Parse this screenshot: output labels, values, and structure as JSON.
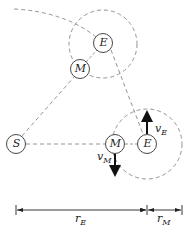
{
  "diagram": {
    "bodies": [
      {
        "id": "sun",
        "label": "S",
        "cx": 16,
        "cy": 144
      },
      {
        "id": "earth-upper",
        "label": "E",
        "cx": 103,
        "cy": 43
      },
      {
        "id": "moon-upper",
        "label": "M",
        "cx": 80,
        "cy": 69
      },
      {
        "id": "moon-lower",
        "label": "M",
        "cx": 115,
        "cy": 144
      },
      {
        "id": "earth-lower",
        "label": "E",
        "cx": 147,
        "cy": 144
      }
    ],
    "velocities": {
      "earth": {
        "symbol": "v",
        "subscript": "E"
      },
      "moon": {
        "symbol": "v",
        "subscript": "M"
      }
    },
    "dimensions": {
      "earth_radius": {
        "symbol": "r",
        "subscript": "E"
      },
      "moon_radius": {
        "symbol": "r",
        "subscript": "M"
      }
    },
    "colors": {
      "line": "#333333",
      "dashed": "#888888"
    }
  }
}
